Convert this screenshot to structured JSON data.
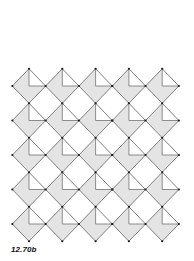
{
  "figure": {
    "label": "12.70b",
    "pattern": {
      "type": "diamond-tiling",
      "columns": 5,
      "rows": 5,
      "origin": {
        "x": 29,
        "y": 86
      },
      "pitch": {
        "x": 33.3,
        "y": 34.5
      },
      "half_width": 16.65,
      "half_height": 17.25,
      "cut": "top-right-triangle",
      "colors": {
        "fill": "#e4e4e4",
        "cut_fill": "#ffffff",
        "edge": "#707070",
        "inner_line": "#808080",
        "vertex": "#1a1a1a"
      },
      "vertex_radius": 1.1
    }
  }
}
